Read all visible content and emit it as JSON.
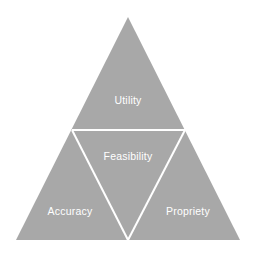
{
  "figure": {
    "type": "triangle-diagram",
    "background_color": "#ffffff",
    "fill_color": "#a8a8a8",
    "line_color": "#ffffff",
    "label_color": "#ffffff",
    "outer_triangle": {
      "apex": [
        128,
        17
      ],
      "bottom_left": [
        16,
        240
      ],
      "bottom_right": [
        240,
        240
      ]
    },
    "inner_inverted_triangle": {
      "left_vertex": [
        72,
        130
      ],
      "right_vertex": [
        185,
        130
      ],
      "bottom_vertex": [
        128,
        240
      ]
    },
    "line_width": 2
  },
  "labels": {
    "utility": "Utility",
    "feasibility": "Feasibility",
    "accuracy": "Accuracy",
    "propriety": "Propriety"
  },
  "chart_data": {
    "type": "diagram",
    "title": "",
    "shape": "equilateral triangle subdivided by an inverted inner triangle",
    "regions": [
      {
        "name": "Utility",
        "position": "top",
        "label": "Utility"
      },
      {
        "name": "Feasibility",
        "position": "center",
        "label": "Feasibility"
      },
      {
        "name": "Accuracy",
        "position": "bottom-left",
        "label": "Accuracy"
      },
      {
        "name": "Propriety",
        "position": "bottom-right",
        "label": "Propriety"
      }
    ],
    "categories": [
      "Utility",
      "Feasibility",
      "Accuracy",
      "Propriety"
    ]
  }
}
